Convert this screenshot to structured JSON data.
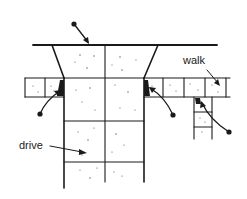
{
  "diagram": {
    "type": "driveway-and-walk joint plan",
    "colors": {
      "line": "#1a1a1a",
      "background": "#ffffff",
      "stipple": "#555555"
    },
    "labels": {
      "walk": "walk",
      "drive": "drive"
    },
    "callouts": [
      {
        "id": "top-edge-joint",
        "target": "top edge of drive apron"
      },
      {
        "id": "left-isolation-joint",
        "target": "junction of drive and left walk"
      },
      {
        "id": "right-isolation-joint",
        "target": "junction of drive and right walk"
      },
      {
        "id": "walk-branch-joint",
        "target": "junction of walk and branch walk"
      }
    ]
  }
}
